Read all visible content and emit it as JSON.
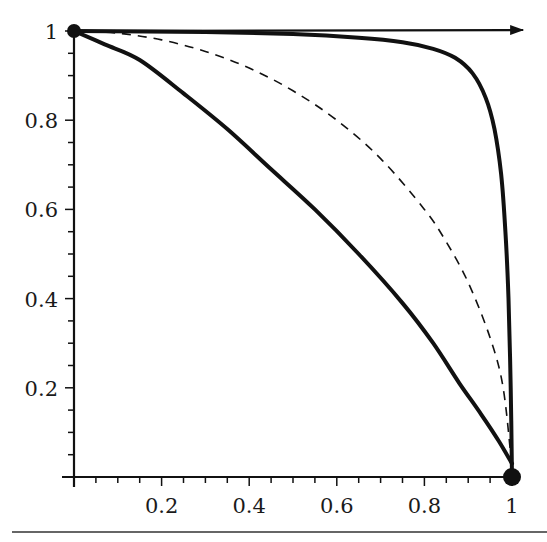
{
  "chart_data": {
    "type": "line",
    "title": "",
    "xlabel": "",
    "ylabel": "",
    "xlim": [
      0,
      1
    ],
    "ylim": [
      0,
      1
    ],
    "grid": false,
    "legend": null,
    "x_ticks": [
      {
        "value": 0.2,
        "label": "0.2"
      },
      {
        "value": 0.4,
        "label": "0.4"
      },
      {
        "value": 0.6,
        "label": "0.6"
      },
      {
        "value": 0.8,
        "label": "0.8"
      },
      {
        "value": 1.0,
        "label": "1"
      }
    ],
    "y_ticks": [
      {
        "value": 0.2,
        "label": "0.2"
      },
      {
        "value": 0.4,
        "label": "0.4"
      },
      {
        "value": 0.6,
        "label": "0.6"
      },
      {
        "value": 0.8,
        "label": "0.8"
      },
      {
        "value": 1.0,
        "label": "1"
      }
    ],
    "minor_tick_step": 0.05,
    "series": [
      {
        "name": "lower-solid-curve",
        "style": "solid",
        "weight": "thick",
        "points": [
          [
            0,
            1
          ],
          [
            0.07,
            0.97
          ],
          [
            0.15,
            0.935
          ],
          [
            0.25,
            0.86
          ],
          [
            0.35,
            0.78
          ],
          [
            0.45,
            0.69
          ],
          [
            0.55,
            0.6
          ],
          [
            0.65,
            0.5
          ],
          [
            0.75,
            0.39
          ],
          [
            0.82,
            0.3
          ],
          [
            0.88,
            0.21
          ],
          [
            0.93,
            0.14
          ],
          [
            0.97,
            0.08
          ],
          [
            1.0,
            0.03
          ]
        ]
      },
      {
        "name": "dashed-curve",
        "style": "dashed",
        "weight": "thin",
        "points": [
          [
            0,
            1
          ],
          [
            0.1,
            0.995
          ],
          [
            0.2,
            0.98
          ],
          [
            0.3,
            0.954
          ],
          [
            0.4,
            0.917
          ],
          [
            0.5,
            0.866
          ],
          [
            0.6,
            0.8
          ],
          [
            0.7,
            0.714
          ],
          [
            0.8,
            0.6
          ],
          [
            0.85,
            0.527
          ],
          [
            0.9,
            0.436
          ],
          [
            0.95,
            0.312
          ],
          [
            0.98,
            0.199
          ],
          [
            1.0,
            0.02
          ]
        ]
      },
      {
        "name": "upper-solid-curve",
        "style": "solid",
        "weight": "thick",
        "points": [
          [
            0,
            1
          ],
          [
            0.3,
            0.998
          ],
          [
            0.5,
            0.993
          ],
          [
            0.65,
            0.985
          ],
          [
            0.75,
            0.975
          ],
          [
            0.82,
            0.96
          ],
          [
            0.87,
            0.94
          ],
          [
            0.91,
            0.905
          ],
          [
            0.94,
            0.85
          ],
          [
            0.96,
            0.78
          ],
          [
            0.975,
            0.68
          ],
          [
            0.985,
            0.55
          ],
          [
            0.992,
            0.4
          ],
          [
            0.997,
            0.2
          ],
          [
            1.0,
            0.0
          ]
        ]
      }
    ],
    "top_arrow": {
      "from": [
        0,
        1
      ],
      "to": [
        1.03,
        1.0
      ],
      "style": "solid"
    },
    "markers": [
      {
        "name": "start-point",
        "x": 0,
        "y": 1
      },
      {
        "name": "end-point",
        "x": 1,
        "y": 0
      }
    ]
  }
}
